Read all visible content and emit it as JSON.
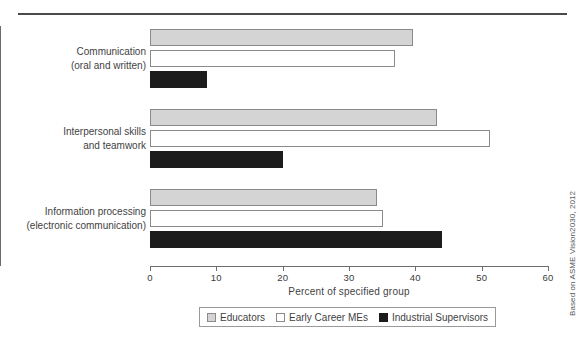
{
  "figure": {
    "credit": "Based on ASME Vision2030, 2012",
    "top_rule": "horizontal-rule"
  },
  "chart_data": {
    "type": "bar",
    "orientation": "horizontal",
    "title": "",
    "xlabel": "Percent of specified group",
    "ylabel": "",
    "xlim": [
      0,
      60
    ],
    "xticks": [
      0,
      10,
      20,
      30,
      40,
      50,
      60
    ],
    "xtick_labels": [
      "0",
      "10",
      "20",
      "30",
      "40",
      "50",
      "60"
    ],
    "grid": false,
    "legend_position": "bottom-center",
    "categories": [
      "Communication\n(oral and written)",
      "Interpersonal skills\nand teamwork",
      "Information processing\n(electronic communication)"
    ],
    "category_lines": [
      [
        "Communication",
        "(oral and written)"
      ],
      [
        "Interpersonal skills",
        "and teamwork"
      ],
      [
        "Information processing",
        "(electronic communication)"
      ]
    ],
    "series": [
      {
        "name": "Educators",
        "color": "#d4d4d4",
        "edge_color": "#8a8a8a",
        "values": [
          39.7,
          43.3,
          34.2
        ]
      },
      {
        "name": "Early Career MEs",
        "color": "#ffffff",
        "edge_color": "#8a8a8a",
        "values": [
          37.0,
          51.3,
          35.1
        ]
      },
      {
        "name": "Industrial Supervisors",
        "color": "#1c1c1c",
        "edge_color": "#1c1c1c",
        "values": [
          8.6,
          20.0,
          44.0
        ]
      }
    ]
  }
}
